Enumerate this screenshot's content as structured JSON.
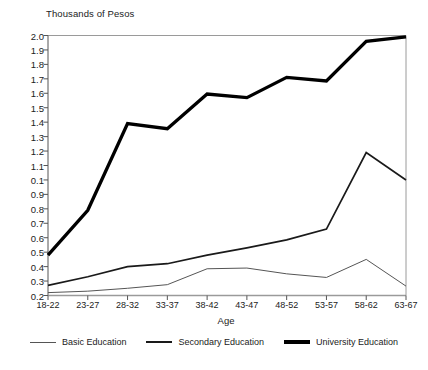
{
  "chart_data": {
    "type": "line",
    "title": "Thousands of Pesos",
    "xlabel": "Age",
    "ylabel": "Thousands of Pesos",
    "categories": [
      "18-22",
      "23-27",
      "28-32",
      "33-37",
      "38-42",
      "43-47",
      "48-52",
      "53-57",
      "58-62",
      "63-67"
    ],
    "ytick_labels": [
      "2.0",
      "1.9",
      "1.8",
      "1.7",
      "1.6",
      "1.5",
      "1.4",
      "1.3",
      "1.2",
      "1.1",
      "0.1",
      "0.9",
      "0.8",
      "0.7",
      "0.6",
      "0.5",
      "0.4",
      "0.3",
      "0.2"
    ],
    "ytick_values": [
      2.0,
      1.9,
      1.8,
      1.7,
      1.6,
      1.5,
      1.4,
      1.3,
      1.2,
      1.1,
      1.0,
      0.9,
      0.8,
      0.7,
      0.6,
      0.5,
      0.4,
      0.3,
      0.2
    ],
    "ylim": [
      0.2,
      2.0
    ],
    "grid": false,
    "legend_position": "bottom",
    "series": [
      {
        "name": "Basic Education",
        "line_width": "thin",
        "color": "#555555",
        "values": [
          0.22,
          0.23,
          0.25,
          0.275,
          0.385,
          0.39,
          0.35,
          0.325,
          0.45,
          0.265
        ]
      },
      {
        "name": "Secondary Education",
        "line_width": "medium",
        "color": "#1a1a1a",
        "values": [
          0.27,
          0.33,
          0.4,
          0.42,
          0.48,
          0.53,
          0.585,
          0.66,
          1.19,
          1.0
        ]
      },
      {
        "name": "University Education",
        "line_width": "thick",
        "color": "#000000",
        "values": [
          0.48,
          0.79,
          1.39,
          1.355,
          1.595,
          1.57,
          1.71,
          1.685,
          1.96,
          1.99
        ]
      }
    ]
  },
  "legend": {
    "items": [
      {
        "label": "Basic Education",
        "swatch": "line-thin-swatch"
      },
      {
        "label": "Secondary Education",
        "swatch": "line-medium-swatch"
      },
      {
        "label": "University Education",
        "swatch": "line-thick-swatch"
      }
    ]
  },
  "axes": {
    "y_axis_title": "Thousands of Pesos",
    "x_axis_title": "Age"
  }
}
